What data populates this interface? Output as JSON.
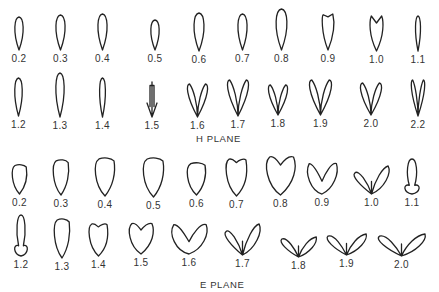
{
  "h_plane": {
    "title": "H PLANE",
    "row1": [
      {
        "label": "0.2",
        "x": 14,
        "shape": "teardrop",
        "w": 10,
        "h": 33,
        "top": 17
      },
      {
        "label": "0.3",
        "x": 55,
        "shape": "teardrop",
        "w": 11,
        "h": 35,
        "top": 15
      },
      {
        "label": "0.4",
        "x": 97,
        "shape": "teardrop",
        "w": 11,
        "h": 36,
        "top": 14
      },
      {
        "label": "0.5",
        "x": 150,
        "shape": "teardrop",
        "w": 10,
        "h": 30,
        "top": 20
      },
      {
        "label": "0.6",
        "x": 193,
        "shape": "teardrop",
        "w": 12,
        "h": 38,
        "top": 13
      },
      {
        "label": "0.7",
        "x": 237,
        "shape": "teardrop",
        "w": 11,
        "h": 36,
        "top": 14
      },
      {
        "label": "0.8",
        "x": 275,
        "shape": "teardrop",
        "w": 13,
        "h": 41,
        "top": 9
      },
      {
        "label": "0.9",
        "x": 322,
        "shape": "notched",
        "w": 12,
        "h": 36,
        "top": 14
      },
      {
        "label": "1.0",
        "x": 370,
        "shape": "notched-deep",
        "w": 13,
        "h": 35,
        "top": 16
      },
      {
        "label": "1.1",
        "x": 415,
        "shape": "slim",
        "w": 6,
        "h": 35,
        "top": 16
      }
    ],
    "row2": [
      {
        "label": "1.2",
        "x": 14,
        "shape": "slim",
        "w": 9,
        "h": 38,
        "top": 78
      },
      {
        "label": "1.3",
        "x": 55,
        "shape": "slim",
        "w": 10,
        "h": 44,
        "top": 73
      },
      {
        "label": "1.4",
        "x": 99,
        "shape": "slim",
        "w": 7,
        "h": 39,
        "top": 78
      },
      {
        "label": "1.5",
        "x": 147,
        "shape": "arrow",
        "w": 10,
        "h": 35,
        "top": 82
      },
      {
        "label": "1.6",
        "x": 187,
        "shape": "v-narrow",
        "w": 21,
        "h": 33,
        "top": 84
      },
      {
        "label": "1.7",
        "x": 227,
        "shape": "v",
        "w": 22,
        "h": 36,
        "top": 80
      },
      {
        "label": "1.8",
        "x": 268,
        "shape": "v",
        "w": 20,
        "h": 30,
        "top": 85
      },
      {
        "label": "1.9",
        "x": 309,
        "shape": "v",
        "w": 23,
        "h": 35,
        "top": 80
      },
      {
        "label": "2.0",
        "x": 360,
        "shape": "v",
        "w": 22,
        "h": 32,
        "top": 83
      },
      {
        "label": "2.2",
        "x": 411,
        "shape": "v-narrow",
        "w": 14,
        "h": 36,
        "top": 80
      }
    ]
  },
  "e_plane": {
    "title": "E PLANE",
    "row1": [
      {
        "label": "0.2",
        "x": 12,
        "shape": "blob",
        "w": 15,
        "h": 30,
        "top": 164
      },
      {
        "label": "0.3",
        "x": 53,
        "shape": "blob",
        "w": 16,
        "h": 36,
        "top": 159
      },
      {
        "label": "0.4",
        "x": 95,
        "shape": "blob",
        "w": 20,
        "h": 39,
        "top": 157
      },
      {
        "label": "0.5",
        "x": 143,
        "shape": "blob",
        "w": 21,
        "h": 40,
        "top": 157
      },
      {
        "label": "0.6",
        "x": 187,
        "shape": "blob",
        "w": 19,
        "h": 33,
        "top": 162
      },
      {
        "label": "0.7",
        "x": 226,
        "shape": "heart-shallow",
        "w": 21,
        "h": 38,
        "top": 158
      },
      {
        "label": "0.8",
        "x": 265,
        "shape": "heart",
        "w": 31,
        "h": 40,
        "top": 155
      },
      {
        "label": "0.9",
        "x": 306,
        "shape": "heart-wide",
        "w": 32,
        "h": 32,
        "top": 162
      },
      {
        "label": "1.0",
        "x": 353,
        "shape": "fan",
        "w": 37,
        "h": 28,
        "top": 166
      },
      {
        "label": "1.1",
        "x": 403,
        "shape": "arrow-wide",
        "w": 18,
        "h": 35,
        "top": 159
      }
    ],
    "row2": [
      {
        "label": "1.2",
        "x": 13,
        "shape": "arrow-wide",
        "w": 16,
        "h": 41,
        "top": 215
      },
      {
        "label": "1.3",
        "x": 54,
        "shape": "blob",
        "w": 16,
        "h": 40,
        "top": 218
      },
      {
        "label": "1.4",
        "x": 89,
        "shape": "heart-shallow",
        "w": 19,
        "h": 33,
        "top": 223
      },
      {
        "label": "1.5",
        "x": 128,
        "shape": "heart",
        "w": 26,
        "h": 32,
        "top": 222
      },
      {
        "label": "1.6",
        "x": 170,
        "shape": "heart-wide",
        "w": 38,
        "h": 31,
        "top": 223
      },
      {
        "label": "1.7",
        "x": 224,
        "shape": "fan",
        "w": 37,
        "h": 31,
        "top": 224
      },
      {
        "label": "1.8",
        "x": 280,
        "shape": "fan-flat",
        "w": 37,
        "h": 20,
        "top": 237
      },
      {
        "label": "1.9",
        "x": 326,
        "shape": "fan-flat",
        "w": 41,
        "h": 21,
        "top": 234
      },
      {
        "label": "2.0",
        "x": 377,
        "shape": "fan-flat",
        "w": 49,
        "h": 22,
        "top": 234
      }
    ]
  }
}
